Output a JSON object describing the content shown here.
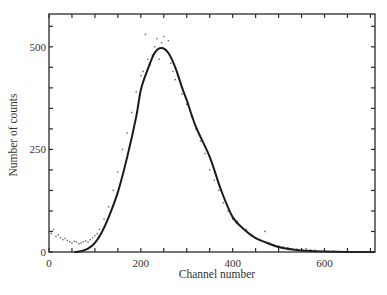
{
  "chart_data": {
    "type": "scatter",
    "title": "",
    "xlabel": "Channel number",
    "ylabel": "Number of counts",
    "xlim": [
      0,
      710
    ],
    "ylim": [
      0,
      580
    ],
    "x_ticks": [
      0,
      200,
      400,
      600
    ],
    "x_minor_step": 50,
    "y_ticks": [
      0,
      250,
      500
    ],
    "y_minor_step": 50,
    "grid": false,
    "legend": null,
    "series": [
      {
        "name": "Fit curve",
        "type": "line",
        "x": [
          55,
          70,
          85,
          100,
          115,
          130,
          150,
          170,
          190,
          200,
          215,
          230,
          245,
          260,
          275,
          290,
          300,
          320,
          350,
          375,
          400,
          425,
          450,
          475,
          500,
          530,
          560,
          600,
          650,
          710
        ],
        "y": [
          0,
          2,
          8,
          22,
          48,
          85,
          146,
          230,
          330,
          395,
          445,
          485,
          497,
          485,
          450,
          400,
          370,
          305,
          232,
          150,
          85,
          55,
          34,
          22,
          12,
          6,
          3,
          1,
          0,
          0
        ]
      },
      {
        "name": "Measured counts",
        "type": "scatter",
        "x": [
          5,
          10,
          15,
          20,
          25,
          30,
          35,
          40,
          45,
          50,
          55,
          60,
          65,
          70,
          75,
          80,
          85,
          90,
          95,
          100,
          105,
          110,
          120,
          130,
          140,
          150,
          160,
          170,
          180,
          190,
          200,
          205,
          210,
          215,
          220,
          225,
          230,
          235,
          240,
          245,
          250,
          255,
          260,
          265,
          270,
          275,
          280,
          290,
          300,
          310,
          320,
          330,
          340,
          350,
          360,
          370,
          380,
          390,
          400,
          410,
          420,
          430,
          440,
          450,
          460,
          470,
          480,
          490,
          500,
          510,
          520,
          530,
          540,
          550,
          560,
          570,
          580,
          600,
          620,
          650
        ],
        "y": [
          45,
          55,
          38,
          42,
          35,
          30,
          33,
          28,
          25,
          22,
          26,
          24,
          20,
          22,
          25,
          27,
          24,
          30,
          35,
          40,
          45,
          55,
          80,
          110,
          150,
          195,
          250,
          290,
          340,
          390,
          430,
          440,
          530,
          470,
          455,
          480,
          500,
          520,
          470,
          510,
          525,
          490,
          515,
          460,
          440,
          420,
          430,
          385,
          360,
          330,
          300,
          270,
          240,
          200,
          175,
          150,
          120,
          100,
          80,
          75,
          60,
          55,
          40,
          35,
          30,
          50,
          22,
          18,
          15,
          12,
          10,
          8,
          7,
          6,
          8,
          5,
          4,
          3,
          2,
          2
        ]
      }
    ]
  },
  "axes": {
    "x_tick_labels": [
      "0",
      "200",
      "400",
      "600"
    ],
    "y_tick_labels": [
      "0",
      "250",
      "500"
    ],
    "xlabel": "Channel number",
    "ylabel": "Number of counts"
  }
}
